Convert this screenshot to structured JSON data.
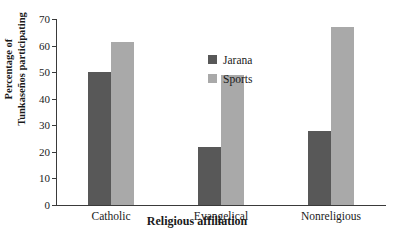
{
  "caption_fragment": "",
  "chart_data": {
    "type": "bar",
    "title": "",
    "xlabel": "Religious affiliation",
    "ylabel_lines": [
      "Percentage of",
      "Tunkaseños participating"
    ],
    "ylabel": "Percentage of Tunkaseños participating",
    "categories": [
      "Catholic",
      "Evangelical",
      "Nonreligious"
    ],
    "series": [
      {
        "name": "Jarana",
        "color": "#585858",
        "values": [
          50,
          22,
          28
        ]
      },
      {
        "name": "Sports",
        "color": "#a9a9a9",
        "values": [
          61.5,
          49,
          67
        ]
      }
    ],
    "ylim": [
      0,
      70
    ],
    "yticks": [
      0,
      10,
      20,
      30,
      40,
      50,
      60,
      70
    ],
    "ytick_labels": [
      "0",
      "10",
      "20",
      "30",
      "40",
      "50",
      "60",
      "70"
    ],
    "grid": false,
    "legend_position": "inside-upper-center",
    "axis_color": "#3a3a3a",
    "background": "#ffffff"
  }
}
